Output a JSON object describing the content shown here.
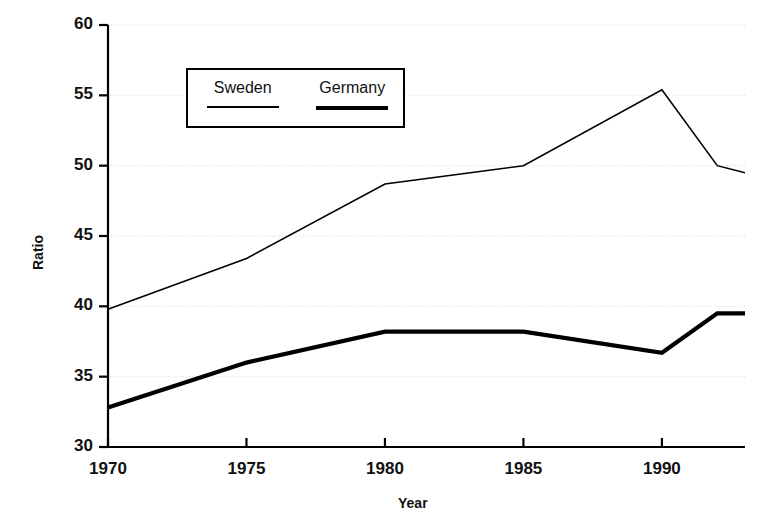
{
  "chart_data": {
    "type": "line",
    "title": "",
    "xlabel": "Year",
    "ylabel": "Ratio",
    "xlim": [
      1970,
      1993
    ],
    "ylim": [
      30,
      60
    ],
    "xticks": [
      1970,
      1975,
      1980,
      1985,
      1990
    ],
    "yticks": [
      30,
      35,
      40,
      45,
      50,
      55,
      60
    ],
    "xtick_labels": [
      "1970",
      "1975",
      "1980",
      "1985",
      "1990"
    ],
    "ytick_labels": [
      "30",
      "35",
      "40",
      "45",
      "50",
      "55",
      "60"
    ],
    "grid": true,
    "grid_style": "dotted",
    "grid_color": "#d9d9d9",
    "legend_position": "upper left inside",
    "x": [
      1970,
      1975,
      1980,
      1985,
      1990,
      1992,
      1993
    ],
    "series": [
      {
        "name": "Sweden",
        "values": [
          39.8,
          43.4,
          48.7,
          50.0,
          55.4,
          50.0,
          49.5
        ],
        "color": "#000000",
        "line_width": 1.6,
        "style": "thin"
      },
      {
        "name": "Germany",
        "values": [
          32.8,
          36.0,
          38.2,
          38.2,
          36.7,
          39.5,
          39.5
        ],
        "color": "#000000",
        "line_width": 4.2,
        "style": "thick"
      }
    ]
  },
  "legend": {
    "entries": [
      {
        "label": "Sweden",
        "swatch_width": 72,
        "swatch_height": 2
      },
      {
        "label": "Germany",
        "swatch_width": 72,
        "swatch_height": 4
      }
    ]
  },
  "axes": {
    "x_title": "Year",
    "y_title": "Ratio"
  },
  "colors": {
    "axis": "#000000",
    "grid": "#d9d9d9",
    "series": "#000000",
    "background": "#ffffff"
  }
}
